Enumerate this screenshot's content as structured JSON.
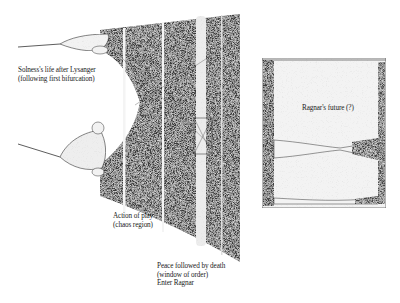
{
  "figure": {
    "type": "bifurcation-diagram",
    "style": "scanned halftone",
    "colors": {
      "ink": "#1e1e1e",
      "chaos_fill": "#3c3c3c",
      "speckle": "#e8e8e8",
      "paper": "#ffffff",
      "light_fill": "#f0f0f0"
    },
    "main_panel": {
      "description": "Period-doubling bifurcation diagram leading into chaos, with periodic windows",
      "annotations": [
        {
          "id": "solness",
          "lines": [
            "Solness's life after Lysanger",
            "(following first bifurcation)"
          ]
        },
        {
          "id": "action",
          "lines": [
            "Action of play",
            "(chaos region)"
          ]
        },
        {
          "id": "peace",
          "lines": [
            "Peace followed by death",
            "(window of order)",
            "Enter Ragnar"
          ]
        }
      ]
    },
    "inset_panel": {
      "description": "Magnified periodic window",
      "annotations": [
        {
          "id": "ragnar",
          "lines": [
            "Ragnar's future (?)"
          ]
        }
      ]
    }
  }
}
